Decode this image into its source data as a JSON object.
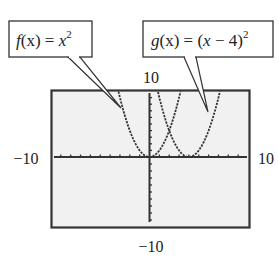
{
  "chart_data": {
    "type": "line",
    "title": "",
    "xlabel": "",
    "ylabel": "",
    "xlim": [
      -10,
      10
    ],
    "ylim": [
      -10,
      10
    ],
    "grid": false,
    "tick_spacing": 1,
    "window_labels": {
      "ymax": "10",
      "ymin": "−10",
      "xmin": "−10",
      "xmax": "10"
    },
    "series": [
      {
        "name": "f(x) = x^2",
        "label_parts": {
          "func": "f",
          "arg": "(x) = ",
          "var": "x",
          "exp": "2"
        },
        "expression": "x^2",
        "shift": 0
      },
      {
        "name": "g(x) = (x − 4)^2",
        "label_parts": {
          "func": "g",
          "arg": "(x) = (",
          "var": "x",
          "rest": " − 4)",
          "exp": "2"
        },
        "expression": "(x-4)^2",
        "shift": 4
      }
    ],
    "annotations": [
      {
        "text": "f(x) = x^2",
        "points_to": "f branch near x = -3"
      },
      {
        "text": "g(x) = (x − 4)^2",
        "points_to": "g branch near x = 6"
      }
    ]
  },
  "colors": {
    "plot_background": "#f1f1f1",
    "axis": "#333333",
    "curve": "#333333",
    "frame": "#333333"
  }
}
